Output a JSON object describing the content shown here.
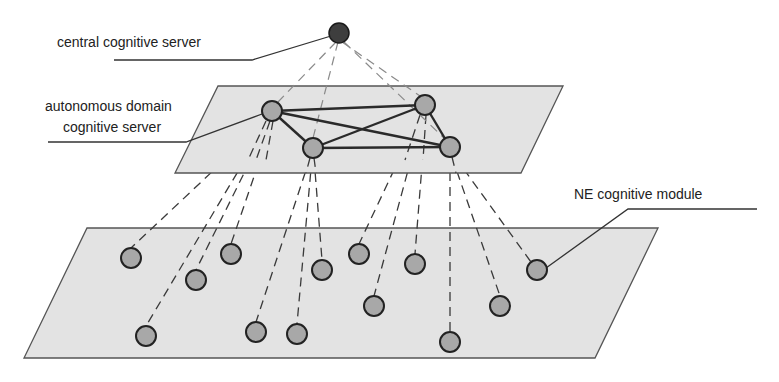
{
  "diagram": {
    "type": "hierarchical cognitive network architecture",
    "labels": {
      "central": "central cognitive server",
      "domain_line1": "autonomous domain",
      "domain_line2": "cognitive server",
      "ne": "NE cognitive module"
    },
    "colors": {
      "plane_fill": "#e3e3e3",
      "node_fill": "#a8a8a8",
      "central_node_fill": "#3e3e3e",
      "line": "#2a2a2a"
    },
    "layers": [
      {
        "name": "central layer",
        "nodes": 1
      },
      {
        "name": "autonomous domain layer",
        "nodes": 4,
        "interconnect": "full mesh"
      },
      {
        "name": "network element layer",
        "nodes": 13
      }
    ]
  }
}
